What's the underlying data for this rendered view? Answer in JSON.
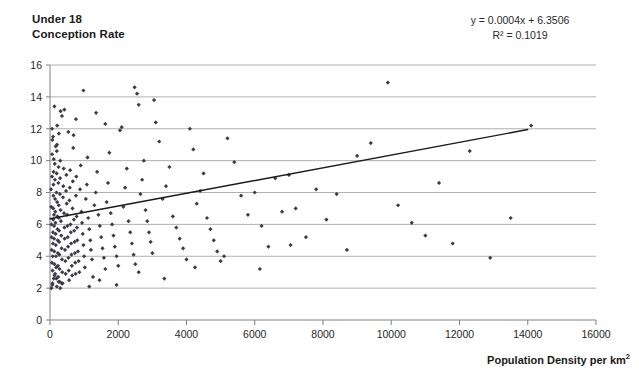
{
  "chart_data": {
    "type": "scatter",
    "title": "Under 18 Conception Rate",
    "title_lines": [
      "Under 18",
      "Conception Rate"
    ],
    "xlabel": "Population Density per km",
    "xlabel_sup": "2",
    "ylabel": "Under 18 Conception Rate",
    "grid": true,
    "grid_axis": "y",
    "legend": "none",
    "xlim": [
      0,
      16000
    ],
    "ylim": [
      0,
      16
    ],
    "xticks": [
      0,
      2000,
      4000,
      6000,
      8000,
      10000,
      12000,
      14000,
      16000
    ],
    "yticks": [
      0,
      2,
      4,
      6,
      8,
      10,
      12,
      14,
      16
    ],
    "xtick_labels": [
      "0",
      "2000",
      "4000",
      "6000",
      "8000",
      "10000",
      "12000",
      "14000",
      "16000"
    ],
    "ytick_labels": [
      "0",
      "2",
      "4",
      "6",
      "8",
      "10",
      "12",
      "14",
      "16"
    ],
    "annotations": [
      {
        "name": "regression-equation",
        "text": "y = 0.0004x + 6.3506"
      },
      {
        "name": "r-squared",
        "text": "R² = 0.1019"
      }
    ],
    "trendline": {
      "type": "linear",
      "slope": 0.0004,
      "intercept": 6.3506,
      "r_squared": 0.1019,
      "equation": "y = 0.0004x + 6.3506",
      "x_start": 0,
      "x_end": 14000,
      "y_start": 6.35,
      "y_end": 11.95,
      "color": "#1a1a1a"
    },
    "series": [
      {
        "name": "Local authority areas",
        "marker": "diamond",
        "color": "#3b3b4a",
        "points": [
          [
            30,
            8.2
          ],
          [
            35,
            7.1
          ],
          [
            40,
            6.0
          ],
          [
            45,
            5.2
          ],
          [
            50,
            4.4
          ],
          [
            55,
            3.6
          ],
          [
            60,
            9.0
          ],
          [
            62,
            10.4
          ],
          [
            68,
            11.3
          ],
          [
            72,
            2.2
          ],
          [
            75,
            3.1
          ],
          [
            80,
            4.0
          ],
          [
            85,
            4.8
          ],
          [
            88,
            5.5
          ],
          [
            92,
            6.3
          ],
          [
            95,
            7.0
          ],
          [
            98,
            7.8
          ],
          [
            100,
            8.5
          ],
          [
            105,
            9.3
          ],
          [
            110,
            10.1
          ],
          [
            115,
            6.6
          ],
          [
            118,
            5.9
          ],
          [
            120,
            5.1
          ],
          [
            125,
            4.3
          ],
          [
            130,
            3.5
          ],
          [
            135,
            2.8
          ],
          [
            140,
            9.8
          ],
          [
            145,
            8.8
          ],
          [
            150,
            7.6
          ],
          [
            155,
            6.8
          ],
          [
            160,
            6.1
          ],
          [
            165,
            5.4
          ],
          [
            170,
            4.7
          ],
          [
            175,
            4.0
          ],
          [
            180,
            3.3
          ],
          [
            185,
            2.6
          ],
          [
            190,
            8.0
          ],
          [
            195,
            9.2
          ],
          [
            200,
            10.6
          ],
          [
            205,
            11.0
          ],
          [
            210,
            7.4
          ],
          [
            215,
            6.5
          ],
          [
            220,
            5.7
          ],
          [
            225,
            5.0
          ],
          [
            230,
            4.2
          ],
          [
            235,
            3.4
          ],
          [
            240,
            2.7
          ],
          [
            245,
            8.6
          ],
          [
            250,
            9.6
          ],
          [
            255,
            7.2
          ],
          [
            260,
            6.4
          ],
          [
            265,
            5.6
          ],
          [
            270,
            4.9
          ],
          [
            275,
            4.1
          ],
          [
            280,
            3.2
          ],
          [
            285,
            2.4
          ],
          [
            290,
            7.9
          ],
          [
            295,
            8.9
          ],
          [
            300,
            10.0
          ],
          [
            310,
            6.9
          ],
          [
            320,
            6.2
          ],
          [
            330,
            5.3
          ],
          [
            340,
            4.5
          ],
          [
            350,
            3.8
          ],
          [
            360,
            3.0
          ],
          [
            370,
            2.3
          ],
          [
            380,
            7.7
          ],
          [
            390,
            8.4
          ],
          [
            400,
            9.5
          ],
          [
            410,
            6.7
          ],
          [
            420,
            5.8
          ],
          [
            430,
            5.1
          ],
          [
            440,
            4.4
          ],
          [
            450,
            3.7
          ],
          [
            460,
            2.9
          ],
          [
            470,
            8.1
          ],
          [
            480,
            9.1
          ],
          [
            490,
            7.3
          ],
          [
            500,
            6.6
          ],
          [
            510,
            5.9
          ],
          [
            520,
            5.2
          ],
          [
            530,
            4.6
          ],
          [
            540,
            3.9
          ],
          [
            550,
            3.1
          ],
          [
            560,
            2.5
          ],
          [
            570,
            7.5
          ],
          [
            580,
            8.3
          ],
          [
            590,
            9.4
          ],
          [
            600,
            6.0
          ],
          [
            610,
            5.5
          ],
          [
            620,
            4.8
          ],
          [
            630,
            4.1
          ],
          [
            640,
            3.4
          ],
          [
            650,
            2.8
          ],
          [
            660,
            7.0
          ],
          [
            670,
            8.7
          ],
          [
            680,
            10.8
          ],
          [
            690,
            11.6
          ],
          [
            700,
            6.3
          ],
          [
            710,
            5.6
          ],
          [
            720,
            4.9
          ],
          [
            730,
            4.2
          ],
          [
            740,
            3.6
          ],
          [
            750,
            2.9
          ],
          [
            760,
            7.8
          ],
          [
            770,
            9.0
          ],
          [
            780,
            6.5
          ],
          [
            790,
            5.8
          ],
          [
            800,
            5.0
          ],
          [
            820,
            4.3
          ],
          [
            840,
            3.7
          ],
          [
            860,
            3.0
          ],
          [
            880,
            8.2
          ],
          [
            900,
            9.7
          ],
          [
            920,
            6.8
          ],
          [
            940,
            6.1
          ],
          [
            960,
            5.4
          ],
          [
            980,
            4.7
          ],
          [
            1000,
            4.0
          ],
          [
            1020,
            3.3
          ],
          [
            1050,
            7.6
          ],
          [
            1080,
            8.5
          ],
          [
            1100,
            10.2
          ],
          [
            1120,
            6.4
          ],
          [
            1150,
            5.7
          ],
          [
            1180,
            5.0
          ],
          [
            1200,
            4.4
          ],
          [
            1230,
            3.8
          ],
          [
            1260,
            2.7
          ],
          [
            1300,
            7.2
          ],
          [
            1340,
            8.0
          ],
          [
            1380,
            9.3
          ],
          [
            1420,
            6.6
          ],
          [
            1460,
            5.9
          ],
          [
            1500,
            5.2
          ],
          [
            1540,
            4.5
          ],
          [
            1580,
            3.9
          ],
          [
            1620,
            3.2
          ],
          [
            1660,
            7.4
          ],
          [
            1700,
            8.6
          ],
          [
            1740,
            10.5
          ],
          [
            1780,
            6.7
          ],
          [
            1820,
            6.0
          ],
          [
            1860,
            5.3
          ],
          [
            1900,
            4.6
          ],
          [
            1950,
            4.0
          ],
          [
            2000,
            3.4
          ],
          [
            2050,
            11.9
          ],
          [
            2100,
            12.1
          ],
          [
            2150,
            7.1
          ],
          [
            2200,
            8.3
          ],
          [
            2250,
            9.5
          ],
          [
            2300,
            6.2
          ],
          [
            2350,
            5.5
          ],
          [
            2400,
            4.8
          ],
          [
            2450,
            4.1
          ],
          [
            2500,
            3.5
          ],
          [
            2550,
            14.2
          ],
          [
            2600,
            13.5
          ],
          [
            2650,
            7.9
          ],
          [
            2700,
            8.8
          ],
          [
            2750,
            10.0
          ],
          [
            2800,
            6.9
          ],
          [
            2850,
            6.2
          ],
          [
            2900,
            5.5
          ],
          [
            2950,
            4.9
          ],
          [
            3000,
            4.2
          ],
          [
            3100,
            12.4
          ],
          [
            3200,
            11.2
          ],
          [
            3300,
            7.6
          ],
          [
            3400,
            8.4
          ],
          [
            3500,
            9.6
          ],
          [
            3600,
            6.5
          ],
          [
            3700,
            5.8
          ],
          [
            3800,
            5.1
          ],
          [
            3900,
            4.5
          ],
          [
            4000,
            3.8
          ],
          [
            4100,
            12.0
          ],
          [
            4200,
            10.7
          ],
          [
            4300,
            7.3
          ],
          [
            4400,
            8.1
          ],
          [
            4500,
            9.2
          ],
          [
            4600,
            6.4
          ],
          [
            4700,
            5.7
          ],
          [
            4800,
            5.0
          ],
          [
            4900,
            4.3
          ],
          [
            5000,
            3.7
          ],
          [
            5200,
            11.4
          ],
          [
            5400,
            9.9
          ],
          [
            5600,
            7.8
          ],
          [
            5800,
            6.6
          ],
          [
            6000,
            8.0
          ],
          [
            6200,
            5.9
          ],
          [
            6400,
            4.6
          ],
          [
            6600,
            8.9
          ],
          [
            6800,
            6.8
          ],
          [
            7000,
            9.1
          ],
          [
            7200,
            7.0
          ],
          [
            7500,
            5.2
          ],
          [
            7800,
            8.2
          ],
          [
            8100,
            6.3
          ],
          [
            8400,
            7.9
          ],
          [
            8700,
            4.4
          ],
          [
            9000,
            10.3
          ],
          [
            9400,
            11.1
          ],
          [
            9900,
            14.9
          ],
          [
            10200,
            7.2
          ],
          [
            10600,
            6.1
          ],
          [
            11000,
            5.3
          ],
          [
            11400,
            8.6
          ],
          [
            11800,
            4.8
          ],
          [
            12300,
            10.6
          ],
          [
            12900,
            3.9
          ],
          [
            13500,
            6.4
          ],
          [
            14100,
            12.2
          ],
          [
            350,
            12.8
          ],
          [
            420,
            13.2
          ],
          [
            540,
            11.8
          ],
          [
            760,
            12.6
          ],
          [
            980,
            14.4
          ],
          [
            1350,
            13.0
          ],
          [
            1620,
            12.3
          ],
          [
            2480,
            14.6
          ],
          [
            3050,
            13.8
          ],
          [
            1150,
            2.1
          ],
          [
            1450,
            2.5
          ],
          [
            1950,
            2.2
          ],
          [
            2600,
            3.0
          ],
          [
            3350,
            2.6
          ],
          [
            4250,
            3.3
          ],
          [
            5100,
            4.0
          ],
          [
            6150,
            3.2
          ],
          [
            7050,
            4.7
          ],
          [
            60,
            12.0
          ],
          [
            90,
            11.5
          ],
          [
            130,
            13.4
          ],
          [
            170,
            10.9
          ],
          [
            210,
            12.2
          ],
          [
            260,
            11.7
          ],
          [
            310,
            13.1
          ],
          [
            40,
            2.0
          ],
          [
            70,
            2.3
          ],
          [
            110,
            2.6
          ],
          [
            150,
            2.9
          ],
          [
            200,
            2.1
          ],
          [
            250,
            2.4
          ],
          [
            300,
            2.0
          ],
          [
            340,
            2.3
          ]
        ]
      }
    ]
  }
}
